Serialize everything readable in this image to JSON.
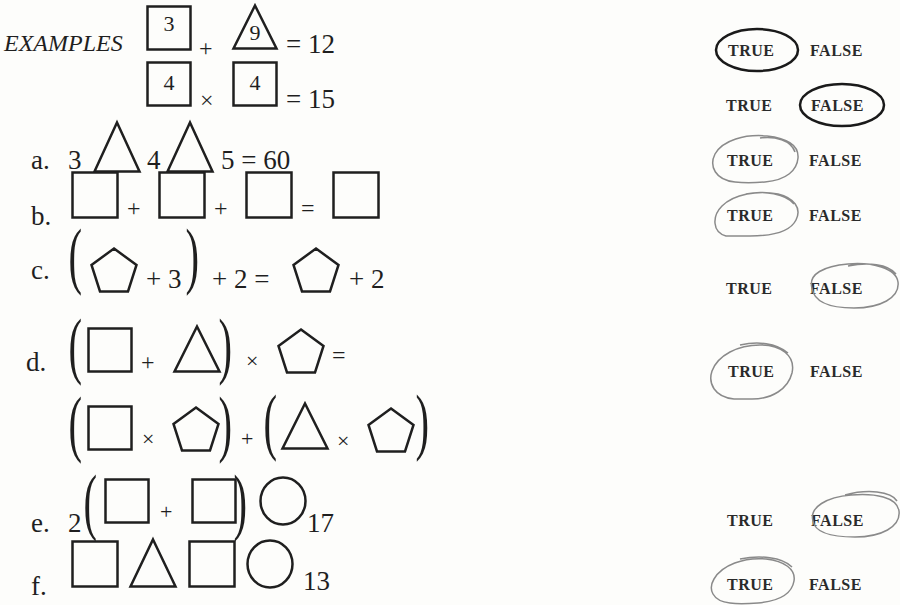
{
  "header": {
    "label": "EXAMPLES"
  },
  "examples": [
    {
      "box1": "3",
      "op": "+",
      "tri": "9",
      "eq": "= 12",
      "answer": "TRUE"
    },
    {
      "box1": "4",
      "op": "×",
      "box2": "4",
      "eq": "= 15",
      "answer": "FALSE"
    }
  ],
  "problems": {
    "a": {
      "label": "a.",
      "n1": "3",
      "n2": "4",
      "n3": "5",
      "eq": "= 60",
      "answer": "TRUE"
    },
    "b": {
      "label": "b.",
      "op1": "+",
      "op2": "+",
      "eq": "=",
      "answer": "TRUE"
    },
    "c": {
      "label": "c.",
      "t1": "+ 3",
      "t2": "+ 2 =",
      "t3": "+ 2",
      "answer": "FALSE"
    },
    "d": {
      "label": "d.",
      "op1": "+",
      "op2": "×",
      "eq": "=",
      "op3": "×",
      "op4": "+",
      "op5": "×",
      "answer": "TRUE"
    },
    "e": {
      "label": "e.",
      "n1": "2",
      "op1": "+",
      "n2": "17",
      "answer": "FALSE"
    },
    "f": {
      "label": "f.",
      "n1": "13",
      "answer": "TRUE"
    }
  },
  "options": {
    "true": "TRUE",
    "false": "FALSE"
  },
  "colors": {
    "ink": "#1f1f1f",
    "printed_circle": "#1a1a1a",
    "pencil_circle": "#8a8a8a"
  }
}
